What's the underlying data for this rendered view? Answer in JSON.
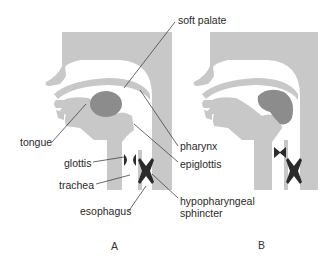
{
  "figure": {
    "colors": {
      "tissue": "#c8c8c8",
      "dark_tissue": "#8c8c8c",
      "muscle": "#2b2b2b",
      "background": "#ffffff",
      "leader": "#444444",
      "text": "#2a2a2a"
    },
    "labels": {
      "soft_palate": "soft palate",
      "tongue": "tongue",
      "pharynx": "pharynx",
      "glottis": "glottis",
      "epiglottis": "epiglottis",
      "trachea": "trachea",
      "esophagus": "esophagus",
      "hypopharyngeal_1": "hypopharyngeal",
      "hypopharyngeal_2": "sphincter"
    },
    "panels": [
      {
        "id": "A",
        "label": "A"
      },
      {
        "id": "B",
        "label": "B"
      }
    ]
  }
}
